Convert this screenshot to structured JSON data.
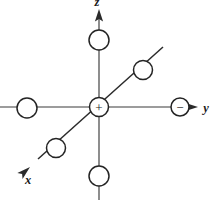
{
  "figure": {
    "background_color": "#ffffff",
    "line_color": "#2b2b2b",
    "axis_color": "#3a3a3a",
    "circle_fill": "#ffffff",
    "circle_stroke": "#242424",
    "width": 222,
    "height": 200
  },
  "axes": [
    {
      "id": "x",
      "label": "x",
      "label_x": 28,
      "label_y": 183,
      "direction": "down-left diagonal",
      "has_arrow": true,
      "line": {
        "x1": 162,
        "y1": 48,
        "x2": 37,
        "y2": 160
      },
      "arrow": {
        "tip_x": 30,
        "tip_y": 168,
        "angle_deg": 139
      }
    },
    {
      "id": "y",
      "label": "y",
      "label_x": 206,
      "label_y": 112,
      "direction": "right horizontal",
      "has_arrow": true,
      "line": {
        "x1": 0,
        "y1": 107,
        "x2": 191,
        "y2": 107
      },
      "arrow": {
        "tip_x": 196,
        "tip_y": 107,
        "angle_deg": 0
      }
    },
    {
      "id": "z",
      "label": "z",
      "label_x": 97,
      "label_y": 3,
      "direction": "up vertical",
      "has_arrow": true,
      "line": {
        "x1": 99,
        "y1": 200,
        "x2": 99,
        "y2": 16
      },
      "arrow": {
        "tip_x": 99,
        "tip_y": 11,
        "angle_deg": -90
      }
    }
  ],
  "sites": [
    {
      "id": "center",
      "name": "center-site",
      "sign": "+",
      "cx": 99,
      "cy": 107,
      "r": 9.5,
      "on_axis": "origin"
    },
    {
      "id": "y-positive",
      "name": "y-positive-site",
      "sign": "−",
      "cx": 180,
      "cy": 107,
      "r": 9,
      "on_axis": "y"
    },
    {
      "id": "y-negative",
      "name": "y-negative-site",
      "sign": "",
      "cx": 27,
      "cy": 108,
      "r": 10,
      "on_axis": "y"
    },
    {
      "id": "z-positive",
      "name": "z-positive-site",
      "sign": "",
      "cx": 99,
      "cy": 40,
      "r": 10,
      "on_axis": "z"
    },
    {
      "id": "z-negative",
      "name": "z-negative-site",
      "sign": "",
      "cx": 99,
      "cy": 176,
      "r": 10,
      "on_axis": "z"
    },
    {
      "id": "x-negative",
      "name": "x-negative-diagonal-site",
      "sign": "",
      "cx": 143,
      "cy": 70,
      "r": 9.5,
      "on_axis": "x"
    },
    {
      "id": "x-positive",
      "name": "x-positive-diagonal-site",
      "sign": "",
      "cx": 56,
      "cy": 148,
      "r": 9.5,
      "on_axis": "x"
    }
  ]
}
